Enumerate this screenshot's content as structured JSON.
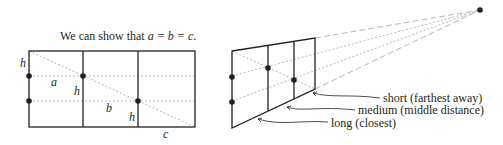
{
  "left_figure": {
    "title_prefix": "We can show that ",
    "title_math": "a = b = c",
    "title_suffix": ".",
    "labels": {
      "h1": "h",
      "a": "a",
      "h2": "h",
      "b": "b",
      "h3": "h",
      "c": "c"
    }
  },
  "right_figure": {
    "annotations": [
      {
        "text": "short (farthest away)"
      },
      {
        "text": "medium (middle distance)"
      },
      {
        "text": "long (closest)"
      }
    ]
  },
  "colors": {
    "ink": "#231f20",
    "guide": "#b8b8b8"
  }
}
